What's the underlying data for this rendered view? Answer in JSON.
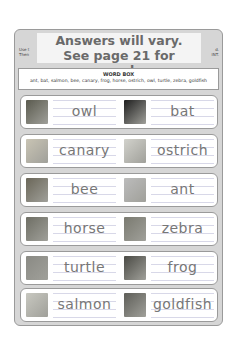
{
  "header": {
    "instruction_left_lines": [
      "Use t",
      "Then"
    ],
    "instruction_right_lines": [
      "d.",
      "INT."
    ],
    "answer_overlay": {
      "line1": "Answers will vary.",
      "line2": "See page 21 for examples."
    }
  },
  "word_box": {
    "title": "WORD BOX",
    "words": "ant, bat, salmon, bee, canary, frog, horse, ostrich, owl, turtle, zebra, goldfish"
  },
  "rows": [
    {
      "left": {
        "word": "owl",
        "photo": "owl-photo",
        "photo_color": "#5a5a4e"
      },
      "right": {
        "word": "bat",
        "photo": "bat-photo",
        "photo_color": "#1e1e1e"
      }
    },
    {
      "left": {
        "word": "canary",
        "photo": "canary-photo",
        "photo_color": "#c9c4b4"
      },
      "right": {
        "word": "ostrich",
        "photo": "ostrich-photo",
        "photo_color": "#d2d2cc"
      }
    },
    {
      "left": {
        "word": "bee",
        "photo": "bee-photo",
        "photo_color": "#6a6658"
      },
      "right": {
        "word": "ant",
        "photo": "ant-photo",
        "photo_color": "#bcbcbc"
      }
    },
    {
      "left": {
        "word": "horse",
        "photo": "horse-photo",
        "photo_color": "#6e6e64"
      },
      "right": {
        "word": "zebra",
        "photo": "zebra-photo",
        "photo_color": "#7a7a70"
      }
    },
    {
      "left": {
        "word": "turtle",
        "photo": "turtle-photo",
        "photo_color": "#8a8a84"
      },
      "right": {
        "word": "frog",
        "photo": "frog-photo",
        "photo_color": "#4a4a44"
      }
    },
    {
      "left": {
        "word": "salmon",
        "photo": "salmon-photo",
        "photo_color": "#c8c8c0"
      },
      "right": {
        "word": "goldfish",
        "photo": "goldfish-photo",
        "photo_color": "#5e5e58"
      }
    }
  ]
}
